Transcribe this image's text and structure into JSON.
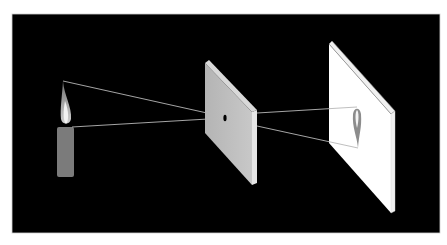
{
  "diagram": {
    "colors": {
      "page_bg": "#ffffff",
      "panel_bg": "#000000",
      "panel_border": "#cfcfcf",
      "candle_body": "#7b7b7b",
      "flame_outer": "#9a9a9a",
      "flame_inner": "#f2f2f2",
      "board_face": "#bdbdbd",
      "board_edge": "#d9d9d9",
      "board_side": "#e6e6e6",
      "pinhole": "#000000",
      "screen_face": "#ffffff",
      "screen_edge": "#8a8a8a",
      "screen_side": "#f0f0f0",
      "image_flame": "#8c8c8c",
      "image_flame_inner": "#f4f4f4",
      "ray": "#b8b8b8"
    },
    "panel": {
      "x": 12,
      "y": 14,
      "w": 428,
      "h": 219
    },
    "candle": {
      "body": {
        "x": 57,
        "y": 127,
        "w": 17,
        "h": 50,
        "rx": 2
      },
      "flame_tip": [
        63,
        81
      ],
      "flame_base": [
        66,
        127
      ]
    },
    "board": {
      "face": "205,63 252,112 252,185 205,133",
      "top_edge": "205,63 209,60 257,110 252,112",
      "side": "252,112 257,110 257,183 252,185",
      "pinhole": {
        "cx": 225,
        "cy": 118,
        "rx": 1.6,
        "ry": 3.2
      }
    },
    "screen": {
      "face": "329,44 391,114 391,213 329,143",
      "top_edge": "329,44 332,41 395,111 391,114",
      "side": "391,114 395,111 395,211 391,213",
      "image": {
        "top": [
          357,
          106
        ],
        "tip": [
          358,
          148
        ]
      }
    },
    "rays": [
      {
        "name": "ray-flame-tip-to-pinhole",
        "x1": 63,
        "y1": 81,
        "x2": 225,
        "y2": 117
      },
      {
        "name": "ray-flame-base-to-pinhole",
        "x1": 72,
        "y1": 127,
        "x2": 225,
        "y2": 118
      },
      {
        "name": "ray-pinhole-to-image-top",
        "x1": 257,
        "y1": 113,
        "x2": 357,
        "y2": 107
      },
      {
        "name": "ray-pinhole-to-image-tip",
        "x1": 257,
        "y1": 126,
        "x2": 358,
        "y2": 148
      }
    ]
  }
}
